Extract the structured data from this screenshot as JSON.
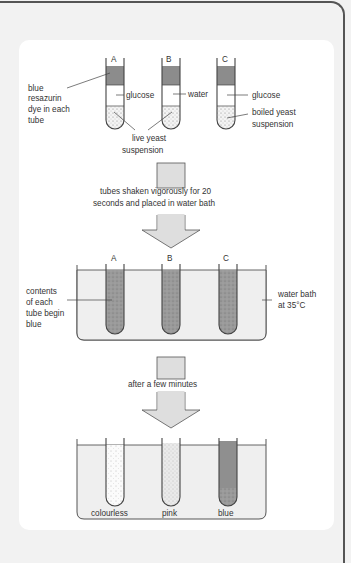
{
  "diagram": {
    "stage1": {
      "tube_labels": [
        "A",
        "B",
        "C"
      ],
      "left_label": [
        "blue",
        "resazurin",
        "dye in each",
        "tube"
      ],
      "tube_contents": {
        "A": {
          "middle": "glucose",
          "bottom": "live yeast suspension"
        },
        "B": {
          "middle": "water",
          "bottom": "live yeast suspension"
        },
        "C": {
          "middle": "glucose",
          "bottom": "boiled yeast suspension"
        }
      },
      "label_glucose_a": "glucose",
      "label_water": "water",
      "label_glucose_c": "glucose",
      "label_boiled": [
        "boiled yeast",
        "suspension"
      ],
      "label_live": [
        "live yeast",
        "suspension"
      ]
    },
    "step1": [
      "tubes shaken vigorously for 20",
      "seconds and placed in water bath"
    ],
    "stage2": {
      "tube_labels": [
        "A",
        "B",
        "C"
      ],
      "left_label": [
        "contents",
        "of each",
        "tube begin",
        "blue"
      ],
      "right_label": [
        "water bath",
        "at 35°C"
      ]
    },
    "step2": "after a few minutes",
    "stage3": {
      "results": [
        "colourless",
        "pink",
        "blue"
      ]
    },
    "colors": {
      "dye": "#8c8c8c",
      "bath": "#efefef",
      "arrow": "#dedede",
      "line": "#444444"
    }
  }
}
